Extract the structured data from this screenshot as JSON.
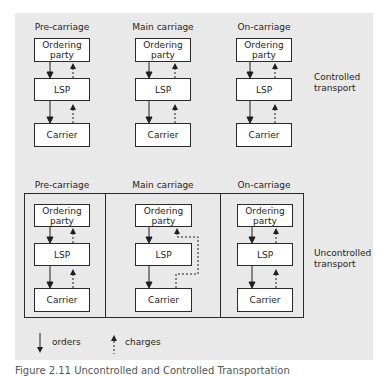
{
  "columns": [
    "Pre-carriage",
    "Main carriage",
    "On-carriage"
  ],
  "boxes": {
    "ordering_party": "Ordering party",
    "lsp": "LSP",
    "carrier": "Carrier"
  },
  "sections": {
    "controlled": {
      "label": "Controlled transport"
    },
    "uncontrolled": {
      "label": "Uncontrolled transport"
    }
  },
  "legend": {
    "orders": "orders",
    "charges": "charges"
  },
  "caption": "Figure 2.11  Uncontrolled and Controlled Transportation",
  "colors": {
    "panel_bg": "#e9e9e9",
    "box_bg": "#ffffff",
    "line": "#2a2a2a"
  }
}
